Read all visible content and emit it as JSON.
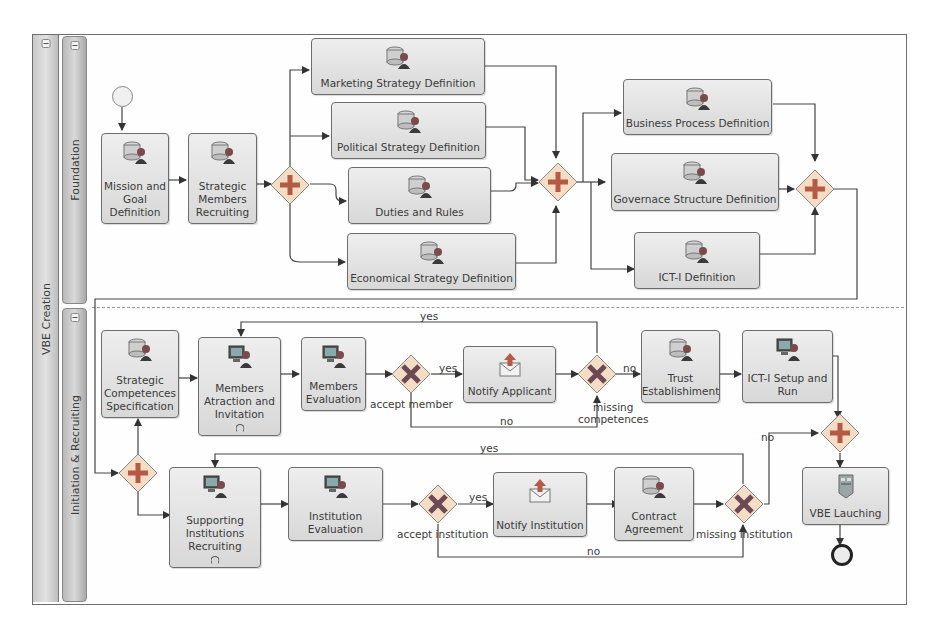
{
  "pool": {
    "name": "VBE Creation",
    "lanes": [
      {
        "name": "Foundation"
      },
      {
        "name": "Initiation & Recruiting"
      }
    ]
  },
  "foundation": {
    "tasks": {
      "mission": "Mission and Goal Definition",
      "mission_lines": [
        "Mission and",
        "Goal",
        "Definition"
      ],
      "strategic_members": [
        "Strategic",
        "Members",
        "Recruiting"
      ],
      "marketing": "Marketing Strategy Definition",
      "political": "Political Strategy Definition",
      "duties": "Duties and Rules",
      "economical": "Economical Strategy Definition",
      "business_process": "Business Process Definition",
      "governance": "Governace Structure Definition",
      "ict_def": "ICT-I Definition"
    }
  },
  "recruiting": {
    "tasks": {
      "competences": [
        "Strategic",
        "Competences",
        "Specification"
      ],
      "members_attraction": [
        "Members",
        "Atraction and",
        "Invitation"
      ],
      "members_eval": [
        "Members",
        "Evaluation"
      ],
      "notify_applicant": "Notify Applicant",
      "trust": [
        "Trust",
        "Establishiment"
      ],
      "ict_setup": [
        "ICT-I Setup and",
        "Run"
      ],
      "supporting": [
        "Supporting",
        "Institutions",
        "Recruiting"
      ],
      "institution_eval": [
        "Institution",
        "Evaluation"
      ],
      "notify_institution": "Notify Institution",
      "contract": [
        "Contract",
        "Agreement"
      ],
      "vbe_launch": "VBE Lauching"
    },
    "gateways": {
      "accept_member": "accept member",
      "missing_competences": [
        "missing",
        "competences"
      ],
      "accept_institution": "accept institution",
      "missing_institution": "missing institution"
    },
    "flow_labels": {
      "yes": "yes",
      "no": "no"
    }
  },
  "icons": {
    "manual_task": "database-person-icon",
    "user_task": "computer-person-icon",
    "send_task": "envelope-send-icon",
    "service_task": "server-icon",
    "parallel_gateway": "plus-icon",
    "exclusive_gateway": "x-icon",
    "loop_marker": "loop-icon"
  },
  "colors": {
    "gateway_fill": "#f5dcc4",
    "gateway_plus": "#b45a45",
    "gateway_x": "#6b4a55",
    "task_fill": "#e4e4e4",
    "stroke": "#555555"
  }
}
